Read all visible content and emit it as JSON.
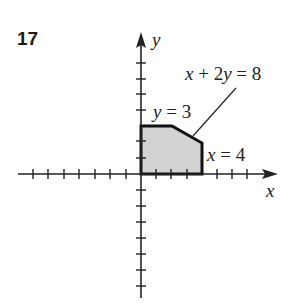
{
  "problem": {
    "number": "17"
  },
  "axes": {
    "x_label": "x",
    "y_label": "y"
  },
  "constraints": [
    {
      "var": "x",
      "rest": " + 2",
      "var2": "y",
      "rest2": " = 8",
      "full": "x + 2y = 8"
    },
    {
      "var": "y",
      "rest": " = 3",
      "full": "y = 3"
    },
    {
      "var": "x",
      "rest": " = 4",
      "full": "x = 4"
    }
  ],
  "region": {
    "vertices": [
      [
        0,
        0
      ],
      [
        0,
        3
      ],
      [
        2,
        3
      ],
      [
        4,
        2
      ],
      [
        4,
        0
      ]
    ],
    "fill": "#d3d3d3",
    "stroke": "#111111"
  },
  "ticks": {
    "x_range": [
      -8,
      8
    ],
    "y_range": [
      -8,
      7
    ]
  }
}
